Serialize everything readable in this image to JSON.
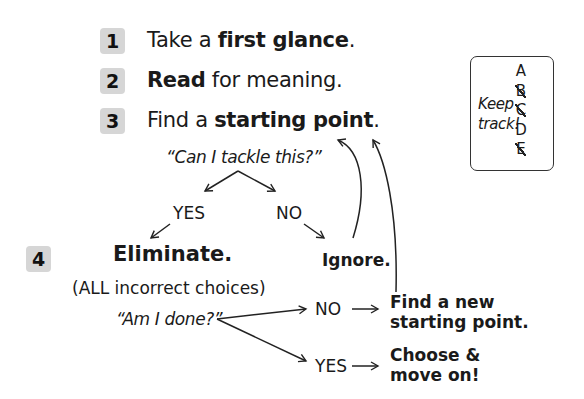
{
  "steps": [
    {
      "number": "1",
      "pre": "Take a ",
      "bold": "first glance",
      "post": "."
    },
    {
      "number": "2",
      "pre": "",
      "bold": "Read",
      "post": " for meaning."
    },
    {
      "number": "3",
      "pre": "Find a ",
      "bold": "starting point",
      "post": "."
    },
    {
      "number": "4",
      "pre": "",
      "bold": "Eliminate.",
      "post": ""
    }
  ],
  "question1": "“Can I tackle this?”",
  "branch1": {
    "yes": "YES",
    "no": "NO",
    "no_result": "Ignore."
  },
  "eliminate_note": "(ALL incorrect choices)",
  "question2": "“Am I done?”",
  "branch2": {
    "no": "NO",
    "no_result_line1": "Find a new",
    "no_result_line2": "starting point.",
    "yes": "YES",
    "yes_result_line1": "Choose &",
    "yes_result_line2": "move on!"
  },
  "keep_track": {
    "line1": "Keep",
    "line2": "track!",
    "letters": [
      {
        "letter": "A",
        "crossed": false
      },
      {
        "letter": "B",
        "crossed": true
      },
      {
        "letter": "C",
        "crossed": true
      },
      {
        "letter": "D",
        "crossed": false
      },
      {
        "letter": "E",
        "crossed": true
      }
    ]
  },
  "colors": {
    "badge": "#d6d6d6",
    "text": "#1a1a1a",
    "lines": "#222222"
  }
}
